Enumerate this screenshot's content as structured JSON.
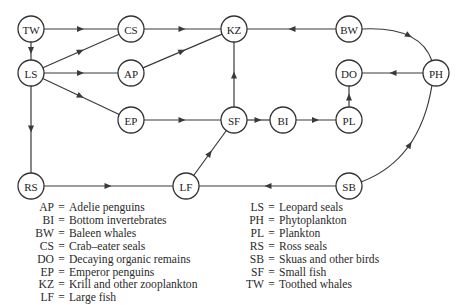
{
  "diagram": {
    "nodes": [
      {
        "id": "TW",
        "label": "TW",
        "x": 31,
        "y": 29
      },
      {
        "id": "CS",
        "label": "CS",
        "x": 131,
        "y": 29
      },
      {
        "id": "KZ",
        "label": "KZ",
        "x": 234,
        "y": 29
      },
      {
        "id": "BW",
        "label": "BW",
        "x": 349,
        "y": 29
      },
      {
        "id": "LS",
        "label": "LS",
        "x": 31,
        "y": 73
      },
      {
        "id": "AP",
        "label": "AP",
        "x": 131,
        "y": 73
      },
      {
        "id": "DO",
        "label": "DO",
        "x": 349,
        "y": 73
      },
      {
        "id": "PH",
        "label": "PH",
        "x": 436,
        "y": 73
      },
      {
        "id": "EP",
        "label": "EP",
        "x": 131,
        "y": 120
      },
      {
        "id": "SF",
        "label": "SF",
        "x": 234,
        "y": 120
      },
      {
        "id": "BI",
        "label": "BI",
        "x": 283,
        "y": 120
      },
      {
        "id": "PL",
        "label": "PL",
        "x": 349,
        "y": 120
      },
      {
        "id": "RS",
        "label": "RS",
        "x": 31,
        "y": 186
      },
      {
        "id": "LF",
        "label": "LF",
        "x": 186,
        "y": 186
      },
      {
        "id": "SB",
        "label": "SB",
        "x": 349,
        "y": 186
      }
    ],
    "edges": [
      {
        "from": "TW",
        "to": "CS"
      },
      {
        "from": "TW",
        "to": "LS"
      },
      {
        "from": "CS",
        "to": "KZ"
      },
      {
        "from": "BW",
        "to": "KZ"
      },
      {
        "from": "BW",
        "to": "PH",
        "curved": true
      },
      {
        "from": "LS",
        "to": "CS"
      },
      {
        "from": "LS",
        "to": "AP"
      },
      {
        "from": "LS",
        "to": "EP"
      },
      {
        "from": "LS",
        "to": "RS"
      },
      {
        "from": "AP",
        "to": "KZ"
      },
      {
        "from": "PH",
        "to": "DO"
      },
      {
        "from": "EP",
        "to": "SF"
      },
      {
        "from": "SF",
        "to": "KZ"
      },
      {
        "from": "SF",
        "to": "BI"
      },
      {
        "from": "BI",
        "to": "PL"
      },
      {
        "from": "PL",
        "to": "DO"
      },
      {
        "from": "RS",
        "to": "LF"
      },
      {
        "from": "LF",
        "to": "SF"
      },
      {
        "from": "SB",
        "to": "LF"
      },
      {
        "from": "SB",
        "to": "PH",
        "curved": true
      }
    ]
  },
  "legend": {
    "left": [
      {
        "abbr": "AP",
        "name": "Adelie penguins"
      },
      {
        "abbr": "BI",
        "name": "Bottom invertebrates"
      },
      {
        "abbr": "BW",
        "name": "Baleen whales"
      },
      {
        "abbr": "CS",
        "name": "Crab–eater seals"
      },
      {
        "abbr": "DO",
        "name": "Decaying organic remains"
      },
      {
        "abbr": "EP",
        "name": "Emperor penguins"
      },
      {
        "abbr": "KZ",
        "name": "Krill and other zooplankton"
      },
      {
        "abbr": "LF",
        "name": "Large fish"
      }
    ],
    "right": [
      {
        "abbr": "LS",
        "name": "Leopard seals"
      },
      {
        "abbr": "PH",
        "name": "Phytoplankton"
      },
      {
        "abbr": "PL",
        "name": "Plankton"
      },
      {
        "abbr": "RS",
        "name": "Ross seals"
      },
      {
        "abbr": "SB",
        "name": "Skuas and other birds"
      },
      {
        "abbr": "SF",
        "name": "Small fish"
      },
      {
        "abbr": "TW",
        "name": "Toothed whales"
      }
    ],
    "equals": "="
  }
}
